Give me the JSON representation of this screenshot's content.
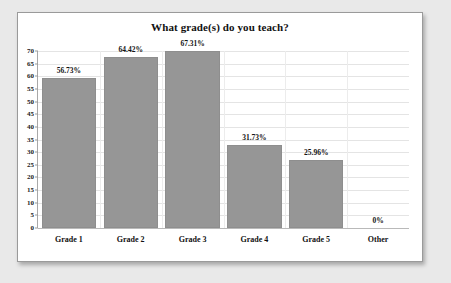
{
  "chart_data": {
    "type": "bar",
    "title": "What grade(s) do you teach?",
    "xlabel": "",
    "ylabel": "",
    "categories": [
      "Grade 1",
      "Grade 2",
      "Grade 3",
      "Grade 4",
      "Grade 5",
      "Other"
    ],
    "values": [
      56.73,
      64.42,
      67.31,
      31.73,
      25.96,
      0
    ],
    "bar_pixel_values": [
      59.5,
      67.5,
      70,
      33,
      27,
      0
    ],
    "data_labels": [
      "56.73%",
      "64.42%",
      "67.31%",
      "31.73%",
      "25.96%",
      "0%"
    ],
    "ylim": [
      0,
      70
    ],
    "ytick_step": 5,
    "ytick_labels": [
      "0",
      "5",
      "10",
      "15",
      "20",
      "25",
      "30",
      "35",
      "40",
      "45",
      "50",
      "55",
      "60",
      "65",
      "70"
    ],
    "grid": true,
    "legend": null,
    "series": [
      {
        "name": "Percent of respondents",
        "values": [
          56.73,
          64.42,
          67.31,
          31.73,
          25.96,
          0
        ]
      }
    ],
    "colors": {
      "bar_fill": "#969696",
      "bar_edge": "#8e8e8e",
      "gridline": "#e4e4e4",
      "axis": "#a8a8a8",
      "text": "#111111",
      "plot_background": "#ffffff",
      "page_background": "#e9e9e9",
      "frame_border": "#9a9a9a"
    }
  }
}
